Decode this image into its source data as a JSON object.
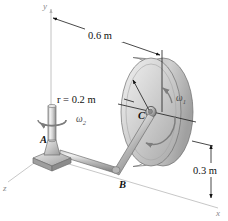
{
  "figure": {
    "background_color": "#ffffff",
    "axes": [
      {
        "name": "y-axis",
        "label": "y",
        "direction": "up"
      },
      {
        "name": "z-axis",
        "label": "z",
        "direction": "down-left"
      },
      {
        "name": "x-axis",
        "label": "x",
        "direction": "down-right"
      }
    ],
    "dimensions": [
      {
        "name": "horizontal-offset",
        "label": "0.6 m",
        "value": 0.6,
        "unit": "m",
        "orientation": "oblique"
      },
      {
        "name": "disk-radius",
        "label": "r = 0.2 m",
        "value": 0.2,
        "unit": "m",
        "orientation": "radial"
      },
      {
        "name": "height-offset",
        "label": "0.3 m",
        "value": 0.3,
        "unit": "m",
        "orientation": "vertical"
      }
    ],
    "points": [
      {
        "name": "point-a",
        "label": "A",
        "description": "base of vertical shaft on pedestal"
      },
      {
        "name": "point-b",
        "label": "B",
        "description": "bend in the rod"
      },
      {
        "name": "point-c",
        "label": "C",
        "description": "center hub of disk"
      }
    ],
    "angular_velocities": [
      {
        "name": "omega-1",
        "symbol": "ω",
        "subscript": "1",
        "location": "about disk axle at C",
        "sense": "counterclockwise"
      },
      {
        "name": "omega-2",
        "symbol": "ω",
        "subscript": "2",
        "location": "about vertical shaft at A",
        "sense": "counterclockwise"
      }
    ],
    "colors": {
      "line": "#1a1a1a",
      "ground": "#b9b9b9",
      "axis": "#c2c2c2",
      "metal_light": "#e6e6e6",
      "metal_mid": "#bdbdbd",
      "metal_dark": "#8f8f8f",
      "omega_arrow": "#7d7d7d"
    }
  }
}
